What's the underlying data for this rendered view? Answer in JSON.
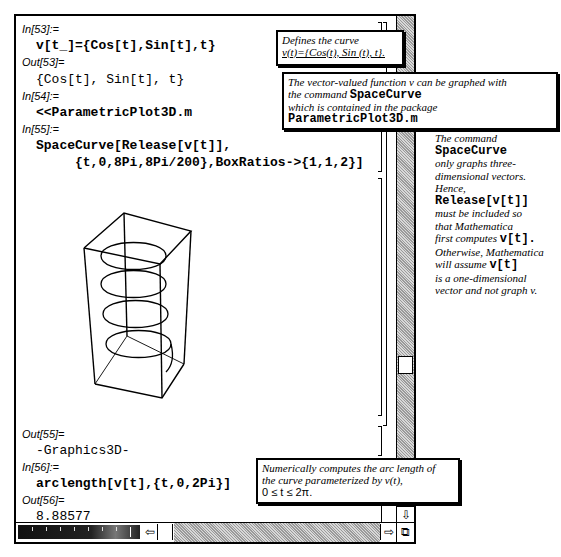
{
  "notebook": {
    "cells": [
      {
        "label": "In[53]:=",
        "code": "v[t_]={Cos[t],Sin[t],t}"
      },
      {
        "label": "Out[53]=",
        "code": "{Cos[t], Sin[t], t}"
      },
      {
        "label": "In[54]:=",
        "code": "<<ParametricPlot3D.m"
      },
      {
        "label": "In[55]:=",
        "code_line1": "SpaceCurve[Release[v[t]],",
        "code_line2": "     {t,0,8Pi,8Pi/200},BoxRatios->{1,1,2}]"
      },
      {
        "label": "Out[55]=",
        "code": "-Graphics3D-"
      },
      {
        "label": "In[56]:=",
        "code": "arclength[v[t],{t,0,2Pi}]"
      },
      {
        "label": "Out[56]=",
        "code": "8.88577"
      }
    ],
    "graphic": {
      "type": "helix-3d",
      "turns": 4,
      "box_ratios": "1,1,2"
    }
  },
  "annotations": {
    "defines": {
      "line1": "Defines the curve",
      "line2": "v(t)={Cos(t), Sin (t), t}."
    },
    "vector_valued": {
      "line1": "The vector-valued function v can be graphed with",
      "line2_prefix": "the command",
      "line2_code": "SpaceCurve",
      "line3": "which is contained in the package",
      "line4_code": "ParametricPlot3D.m"
    },
    "side": {
      "l1": "The command",
      "l2": "SpaceCurve",
      "l3": "only graphs three-",
      "l4": "dimensional vectors.",
      "l5": "Hence,",
      "l6": "Release[v[t]]",
      "l7": "must be included so",
      "l8": "that Mathematica",
      "l9_prefix": "first computes",
      "l9_code": "v[t].",
      "l10": "Otherwise, Mathematica",
      "l11_prefix": "will assume",
      "l11_code": "v[t]",
      "l12": "is a one-dimensional",
      "l13": "vector and not graph v."
    },
    "arclength": {
      "line1": "Numerically computes the arc length of",
      "line2": "the curve parameterized by v(t),",
      "line3": "0 ≤ t ≤ 2π."
    }
  },
  "scrollbars": {
    "up_arrow": "⇧",
    "down_arrow": "⇩",
    "left_arrow": "⇦",
    "right_arrow": "⇨",
    "resize": "⧉"
  }
}
